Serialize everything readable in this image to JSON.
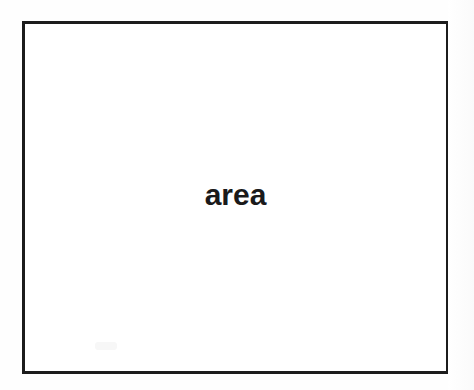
{
  "page": {
    "background_color": "#fefefe",
    "width": 474,
    "height": 390
  },
  "diagram": {
    "name": "area-box",
    "border_color": "#1c1c1c",
    "border_width_px": 3,
    "fill_color": "#ffffff",
    "caption": "area",
    "caption_color": "#1a1a1a",
    "caption_weight": "bold",
    "caption_font_size_px": 30
  }
}
